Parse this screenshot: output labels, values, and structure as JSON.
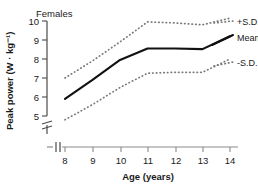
{
  "chart_data": {
    "type": "line",
    "title": "Females",
    "xlabel": "Age (years)",
    "ylabel": "Peak power (W · kg⁻¹)",
    "x": [
      8,
      9,
      10,
      11,
      12,
      13,
      14
    ],
    "xlim": [
      8,
      14
    ],
    "ylim": [
      4.6,
      10.4
    ],
    "xticks": [
      8,
      9,
      10,
      11,
      12,
      13,
      14
    ],
    "xticklabels": [
      "8",
      "9",
      "10",
      "11",
      "12",
      "13",
      "14"
    ],
    "yticks": [
      5,
      6,
      7,
      8,
      9,
      10
    ],
    "yticklabels": [
      "5",
      "6",
      "7",
      "8",
      "9",
      "10"
    ],
    "grid": false,
    "axis_break_y": true,
    "axis_break_x": true,
    "legend_position": "right",
    "series": [
      {
        "name": "+S.D.",
        "style": "dotted",
        "color": "#7a7a7a",
        "values": [
          7.0,
          7.9,
          8.9,
          9.95,
          9.9,
          9.8,
          10.15
        ]
      },
      {
        "name": "Mean",
        "style": "solid",
        "color": "#111111",
        "values": [
          5.9,
          6.9,
          7.95,
          8.55,
          8.55,
          8.52,
          9.2
        ]
      },
      {
        "name": "-S.D.",
        "style": "dotted",
        "color": "#7a7a7a",
        "values": [
          4.8,
          5.6,
          6.5,
          7.25,
          7.3,
          7.3,
          8.0
        ]
      }
    ]
  },
  "legend": {
    "items": [
      {
        "label": "+S.D."
      },
      {
        "label": "Mean"
      },
      {
        "label": "-S.D."
      }
    ]
  },
  "colors": {
    "mean_line": "#111111",
    "sd_line": "#7a7a7a",
    "axis": "#4a4a4a",
    "text": "#1a1a1a",
    "background": "#ffffff"
  }
}
